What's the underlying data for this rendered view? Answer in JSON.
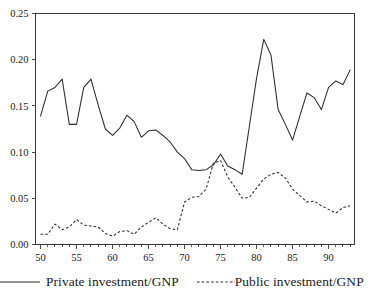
{
  "chart_data": {
    "type": "line",
    "title": "",
    "subtitle": "",
    "xlabel": "",
    "ylabel": "",
    "xlim": [
      49.3,
      93.6
    ],
    "ylim": [
      0.0,
      0.25
    ],
    "grid": false,
    "legend_position": "bottom",
    "x_tick_labels": [
      "50",
      "55",
      "60",
      "65",
      "70",
      "75",
      "80",
      "85",
      "90"
    ],
    "x_tick_values": [
      50,
      55,
      60,
      65,
      70,
      75,
      80,
      85,
      90
    ],
    "x_minor_tick_step": 1,
    "y_tick_labels": [
      "0.00",
      "0.05",
      "0.10",
      "0.15",
      "0.20",
      "0.25"
    ],
    "y_tick_values": [
      0.0,
      0.05,
      0.1,
      0.15,
      0.2,
      0.25
    ],
    "x": [
      50,
      51,
      52,
      53,
      54,
      55,
      56,
      57,
      58,
      59,
      60,
      61,
      62,
      63,
      64,
      65,
      66,
      67,
      68,
      69,
      70,
      71,
      72,
      73,
      74,
      75,
      76,
      77,
      78,
      79,
      80,
      81,
      82,
      83,
      84,
      85,
      86,
      87,
      88,
      89,
      90,
      91,
      92,
      93
    ],
    "series": [
      {
        "name": "Private investment/GNP",
        "style": "solid",
        "color": "#2b2b2b",
        "values": [
          0.139,
          0.166,
          0.17,
          0.179,
          0.13,
          0.13,
          0.17,
          0.179,
          0.151,
          0.125,
          0.118,
          0.126,
          0.14,
          0.133,
          0.116,
          0.123,
          0.124,
          0.118,
          0.111,
          0.1,
          0.093,
          0.081,
          0.08,
          0.081,
          0.086,
          0.098,
          0.085,
          0.081,
          0.076,
          0.128,
          0.18,
          0.222,
          0.205,
          0.146,
          0.13,
          0.113,
          0.139,
          0.164,
          0.159,
          0.146,
          0.17,
          0.177,
          0.173,
          0.189
        ]
      },
      {
        "name": "Public investment/GNP",
        "style": "dotted",
        "color": "#2b2b2b",
        "values": [
          0.011,
          0.011,
          0.022,
          0.016,
          0.019,
          0.027,
          0.021,
          0.02,
          0.019,
          0.012,
          0.009,
          0.014,
          0.015,
          0.011,
          0.019,
          0.024,
          0.029,
          0.022,
          0.017,
          0.016,
          0.046,
          0.051,
          0.052,
          0.06,
          0.088,
          0.091,
          0.073,
          0.062,
          0.05,
          0.051,
          0.061,
          0.071,
          0.076,
          0.078,
          0.072,
          0.06,
          0.053,
          0.046,
          0.047,
          0.042,
          0.038,
          0.034,
          0.04,
          0.042
        ]
      }
    ],
    "legend": [
      {
        "label": "Private investment/GNP",
        "style": "solid"
      },
      {
        "label": "Public investment/GNP",
        "style": "dotted"
      }
    ]
  }
}
